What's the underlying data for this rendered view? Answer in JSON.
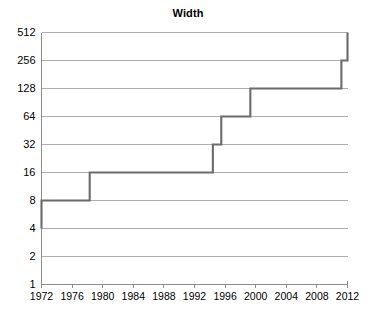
{
  "chart_data": {
    "type": "line",
    "title": "Width",
    "xlabel": "",
    "ylabel": "",
    "grid": true,
    "legend": false,
    "y_scale": "log2",
    "xlim": [
      1972,
      2012
    ],
    "ylim": [
      1,
      512
    ],
    "x_ticks": [
      1972,
      1976,
      1980,
      1984,
      1988,
      1992,
      1996,
      2000,
      2004,
      2008,
      2012
    ],
    "x_tick_labels": [
      "1972",
      "1976",
      "1980",
      "1984",
      "1988",
      "1992",
      "1996",
      "2000",
      "2004",
      "2008",
      "2012"
    ],
    "y_ticks": [
      1,
      2,
      4,
      8,
      16,
      32,
      64,
      128,
      256,
      512
    ],
    "y_tick_labels": [
      "1",
      "2",
      "4",
      "8",
      "16",
      "32",
      "64",
      "128",
      "256",
      "512"
    ],
    "series": [
      {
        "name": "Width",
        "drawstyle": "steps-post",
        "color": "#6b6b6b",
        "x": [
          1972,
          1972,
          1978.3,
          1994.4,
          1995.5,
          1999.3,
          2011.2,
          2012
        ],
        "y": [
          4,
          8,
          16,
          32,
          64,
          128,
          256,
          512
        ],
        "points": [
          {
            "year": 1972,
            "width": 4
          },
          {
            "year": 1972,
            "width": 8
          },
          {
            "year": 1978.3,
            "width": 16
          },
          {
            "year": 1994.4,
            "width": 32
          },
          {
            "year": 1995.5,
            "width": 64
          },
          {
            "year": 1999.3,
            "width": 128
          },
          {
            "year": 2011.2,
            "width": 256
          },
          {
            "year": 2012,
            "width": 512
          }
        ]
      }
    ]
  },
  "colors": {
    "line": "#6b6b6b",
    "grid": "#9a9a9a",
    "axis": "#8c8c8c",
    "text": "#000000",
    "background": "#ffffff"
  }
}
